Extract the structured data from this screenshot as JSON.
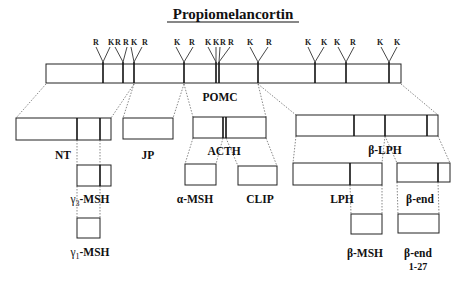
{
  "title": "Propiomelancortin",
  "precursor": {
    "label": "POMC",
    "cleavage_sites": [
      "R",
      "K",
      "R",
      "R",
      "K",
      "R",
      "K",
      "R",
      "K",
      "K",
      "R",
      "R",
      "K",
      "R",
      "K",
      "K",
      "K",
      "R",
      "K",
      "K"
    ]
  },
  "fragments": {
    "nt": "NT",
    "jp": "JP",
    "acth": "ACTH",
    "beta_lph": "β-LPH",
    "gamma3_msh_greek": "γ",
    "gamma3_msh_sub": "3",
    "gamma3_msh_suffix": "-MSH",
    "gamma1_msh_greek": "γ",
    "gamma1_msh_sub": "1",
    "gamma1_msh_suffix": "-MSH",
    "alpha_msh": "α-MSH",
    "clip": "CLIP",
    "lph": "LPH",
    "beta_end": "β-end",
    "beta_msh": "β-MSH",
    "beta_end_1_27_line1": "β-end",
    "beta_end_1_27_line2": "1-27"
  }
}
